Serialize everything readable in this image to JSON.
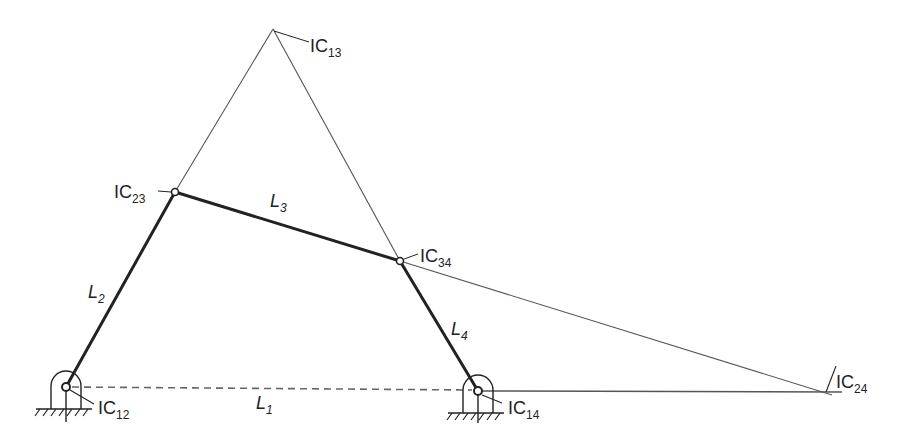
{
  "diagram": {
    "type": "four-bar linkage instant centers",
    "colors": {
      "ink": "#222222",
      "thin": "#555555",
      "background": "#ffffff"
    },
    "points": {
      "IC12": {
        "x": 66,
        "y": 387
      },
      "IC14": {
        "x": 478,
        "y": 391
      },
      "IC23": {
        "x": 175,
        "y": 192
      },
      "IC34": {
        "x": 400,
        "y": 261
      },
      "IC13": {
        "x": 273,
        "y": 29
      },
      "IC24": {
        "x": 826,
        "y": 392
      }
    },
    "links": [
      {
        "name": "L1",
        "from": "IC12",
        "to": "IC14",
        "style": "dashed"
      },
      {
        "name": "L2",
        "from": "IC12",
        "to": "IC23",
        "style": "thick"
      },
      {
        "name": "L3",
        "from": "IC23",
        "to": "IC34",
        "style": "thick"
      },
      {
        "name": "L4",
        "from": "IC34",
        "to": "IC14",
        "style": "thick"
      }
    ],
    "construction_lines": [
      {
        "from": "IC23",
        "to": "IC13"
      },
      {
        "from": "IC13",
        "to": "IC34"
      },
      {
        "from": "IC34",
        "to": "IC24"
      },
      {
        "from": "IC14",
        "to": "IC24"
      }
    ]
  },
  "labels": {
    "ic12": {
      "main": "IC",
      "sub": "12"
    },
    "ic13": {
      "main": "IC",
      "sub": "13"
    },
    "ic14": {
      "main": "IC",
      "sub": "14"
    },
    "ic23": {
      "main": "IC",
      "sub": "23"
    },
    "ic24": {
      "main": "IC",
      "sub": "24"
    },
    "ic34": {
      "main": "IC",
      "sub": "34"
    },
    "l1": {
      "main": "L",
      "sub": "1"
    },
    "l2": {
      "main": "L",
      "sub": "2"
    },
    "l3": {
      "main": "L",
      "sub": "3"
    },
    "l4": {
      "main": "L",
      "sub": "4"
    }
  }
}
